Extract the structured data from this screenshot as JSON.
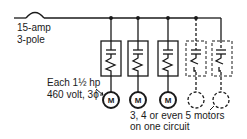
{
  "breaker": {
    "line1": "15-amp",
    "line2": "3-pole"
  },
  "motor_spec": {
    "line1": "Each 1½ hp",
    "line2": "460 volt, 3ϕ"
  },
  "note": {
    "line1": "3, 4 or even 5 motors",
    "line2": "on one circuit"
  },
  "motor_label": "M",
  "branches": [
    {
      "x": 111,
      "style": "solid",
      "motor": true
    },
    {
      "x": 138,
      "style": "solid",
      "motor": true
    },
    {
      "x": 168,
      "style": "solid",
      "motor": true
    },
    {
      "x": 196,
      "style": "dashed",
      "motor": false
    },
    {
      "x": 221,
      "style": "dashed",
      "motor": false
    }
  ],
  "colors": {
    "ink": "#1a1a1a",
    "background": "#ffffff"
  }
}
